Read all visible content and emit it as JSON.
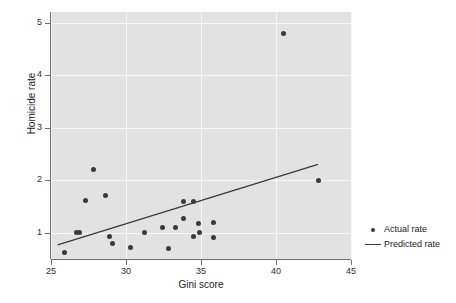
{
  "chart_data": {
    "type": "scatter",
    "title": "",
    "xlabel": "Gini score",
    "ylabel": "Homicide rate",
    "xlim": [
      25,
      45
    ],
    "ylim": [
      0.5,
      5.2
    ],
    "xticks": [
      25,
      30,
      35,
      40,
      45
    ],
    "yticks": [
      1,
      2,
      3,
      4,
      5
    ],
    "xtick_labels": [
      "25",
      "30",
      "35",
      "40",
      "45"
    ],
    "ytick_labels": [
      "1",
      "2",
      "3",
      "4",
      "5"
    ],
    "grid": true,
    "panel_color": "#e2e2e2",
    "grid_color": "#f7f7f7",
    "marker_color": "#3a3a3a",
    "line_color": "#3a3a3a",
    "legend_position": "right",
    "series": [
      {
        "name": "Actual rate",
        "type": "scatter",
        "points": [
          {
            "x": 25.9,
            "y": 0.63
          },
          {
            "x": 26.7,
            "y": 1.01
          },
          {
            "x": 26.9,
            "y": 1.01
          },
          {
            "x": 27.3,
            "y": 1.62
          },
          {
            "x": 27.8,
            "y": 2.21
          },
          {
            "x": 28.6,
            "y": 1.71
          },
          {
            "x": 28.9,
            "y": 0.92
          },
          {
            "x": 29.1,
            "y": 0.8
          },
          {
            "x": 30.3,
            "y": 0.72
          },
          {
            "x": 31.2,
            "y": 1.0
          },
          {
            "x": 32.4,
            "y": 1.1
          },
          {
            "x": 32.8,
            "y": 0.71
          },
          {
            "x": 33.3,
            "y": 1.1
          },
          {
            "x": 33.8,
            "y": 1.28
          },
          {
            "x": 33.8,
            "y": 1.6
          },
          {
            "x": 34.5,
            "y": 1.59
          },
          {
            "x": 34.5,
            "y": 0.92
          },
          {
            "x": 34.9,
            "y": 1.0
          },
          {
            "x": 34.8,
            "y": 1.18
          },
          {
            "x": 35.8,
            "y": 1.19
          },
          {
            "x": 35.8,
            "y": 0.91
          },
          {
            "x": 40.5,
            "y": 4.8
          },
          {
            "x": 42.8,
            "y": 2.0
          }
        ]
      },
      {
        "name": "Predicted rate",
        "type": "line",
        "points": [
          {
            "x": 25.45,
            "y": 0.77
          },
          {
            "x": 42.8,
            "y": 2.3
          }
        ]
      }
    ]
  },
  "legend": {
    "items": [
      {
        "label": "Actual rate",
        "key": "dot-marker"
      },
      {
        "label": "Predicted rate",
        "key": "line-marker"
      }
    ]
  }
}
